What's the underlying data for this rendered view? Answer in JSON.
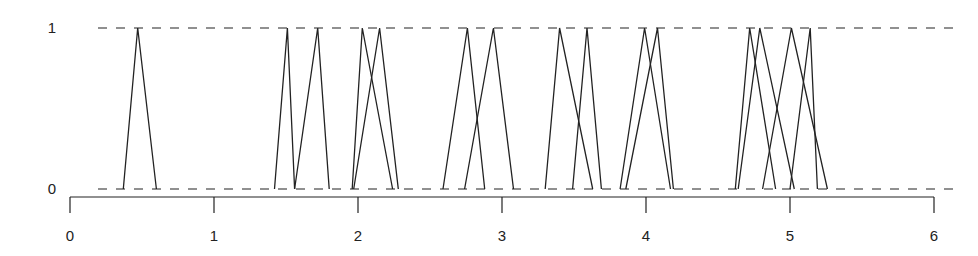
{
  "chart_data": {
    "type": "line",
    "title": "",
    "xlabel": "",
    "ylabel": "",
    "xlim": [
      0,
      6
    ],
    "ylim": [
      0,
      1
    ],
    "x_ticks": [
      0,
      1,
      2,
      3,
      4,
      5,
      6
    ],
    "x_tick_labels": [
      "0",
      "1",
      "2",
      "3",
      "4",
      "5",
      "6"
    ],
    "y_ticks": [
      0,
      1
    ],
    "y_tick_labels": [
      "0",
      "1"
    ],
    "reference_lines": [
      {
        "y": 0,
        "style": "dashed"
      },
      {
        "y": 1,
        "style": "dashed"
      }
    ],
    "grid": false,
    "legend": null,
    "series": [
      {
        "name": "t1",
        "x": [
          0.37,
          0.47,
          0.6
        ],
        "y": [
          0,
          1,
          0
        ]
      },
      {
        "name": "t2",
        "x": [
          1.42,
          1.51,
          1.56
        ],
        "y": [
          0,
          1,
          0
        ]
      },
      {
        "name": "t3",
        "x": [
          1.56,
          1.72,
          1.8
        ],
        "y": [
          0,
          1,
          0
        ]
      },
      {
        "name": "t4",
        "x": [
          1.96,
          2.03,
          2.24
        ],
        "y": [
          0,
          1,
          0
        ]
      },
      {
        "name": "t5",
        "x": [
          1.97,
          2.15,
          2.28
        ],
        "y": [
          0,
          1,
          0
        ]
      },
      {
        "name": "t6",
        "x": [
          2.59,
          2.76,
          2.88
        ],
        "y": [
          0,
          1,
          0
        ]
      },
      {
        "name": "t7",
        "x": [
          2.74,
          2.94,
          3.08
        ],
        "y": [
          0,
          1,
          0
        ]
      },
      {
        "name": "t8",
        "x": [
          3.3,
          3.4,
          3.63
        ],
        "y": [
          0,
          1,
          0
        ]
      },
      {
        "name": "t9",
        "x": [
          3.49,
          3.59,
          3.69
        ],
        "y": [
          0,
          1,
          0
        ]
      },
      {
        "name": "t10",
        "x": [
          3.82,
          3.99,
          4.17
        ],
        "y": [
          0,
          1,
          0
        ]
      },
      {
        "name": "t11",
        "x": [
          3.86,
          4.08,
          4.19
        ],
        "y": [
          0,
          1,
          0
        ]
      },
      {
        "name": "t12",
        "x": [
          4.62,
          4.72,
          4.9
        ],
        "y": [
          0,
          1,
          0
        ]
      },
      {
        "name": "t13",
        "x": [
          4.64,
          4.79,
          5.03
        ],
        "y": [
          0,
          1,
          0
        ]
      },
      {
        "name": "t14",
        "x": [
          4.81,
          5.01,
          5.26
        ],
        "y": [
          0,
          1,
          0
        ]
      },
      {
        "name": "t15",
        "x": [
          5.0,
          5.14,
          5.19
        ],
        "y": [
          0,
          1,
          0
        ]
      }
    ]
  },
  "colors": {
    "line": "#222222",
    "axis": "#222222",
    "background": "#ffffff"
  }
}
